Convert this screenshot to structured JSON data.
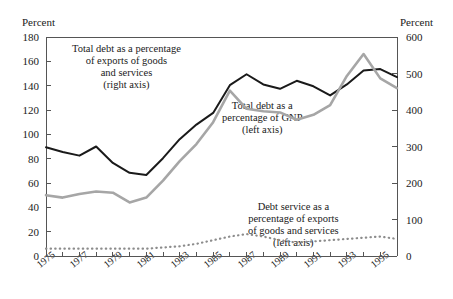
{
  "axes": {
    "left_unit": "Percent",
    "right_unit": "Percent",
    "left_ticks": [
      "180",
      "160",
      "140",
      "120",
      "100",
      "80",
      "60",
      "40",
      "20",
      "0"
    ],
    "right_ticks": [
      "600",
      "500",
      "400",
      "300",
      "200",
      "100",
      "0"
    ],
    "x_ticks": [
      "1975",
      "1977",
      "1979",
      "1981",
      "1983",
      "1985",
      "1987",
      "1989",
      "1991",
      "1993",
      "1995"
    ]
  },
  "annotations": {
    "exports": {
      "line1": "Total debt as a percentage",
      "line2": "of exports of goods",
      "line3": "and services",
      "line4": "(right axis)"
    },
    "gnp": {
      "line1": "Total debt as a",
      "line2": "percentage of GNP",
      "line3": "(left axis)"
    },
    "service": {
      "line1": "Debt service as a",
      "line2": "percentage of exports",
      "line3": "of goods and services",
      "line4": "(left axis)"
    }
  },
  "colors": {
    "exports_line": "#1a1a1a",
    "gnp_line": "#a6a6a6",
    "service_line": "#8c8c8c",
    "frame": "#555555",
    "background": "#ffffff"
  },
  "chart_data": {
    "type": "line",
    "title": "",
    "xlabel": "",
    "ylabel": "Percent",
    "y2label": "Percent",
    "x": [
      1975,
      1976,
      1977,
      1978,
      1979,
      1980,
      1981,
      1982,
      1983,
      1984,
      1985,
      1986,
      1987,
      1988,
      1989,
      1990,
      1991,
      1992,
      1993,
      1994,
      1995,
      1996
    ],
    "xlim": [
      1975,
      1996
    ],
    "ylim": [
      0,
      180
    ],
    "y2lim": [
      0,
      600
    ],
    "grid": false,
    "legend": "inline-annotations",
    "series": [
      {
        "name": "Total debt as a percentage of exports of goods and services",
        "axis": "right",
        "unit": "percent",
        "style": "solid-dark",
        "color": "#1a1a1a",
        "values": [
          298,
          285,
          275,
          300,
          255,
          228,
          222,
          268,
          320,
          360,
          392,
          468,
          498,
          470,
          458,
          480,
          465,
          440,
          470,
          508,
          512,
          490
        ]
      },
      {
        "name": "Total debt as a percentage of GNP",
        "axis": "left",
        "unit": "percent",
        "style": "solid-grey",
        "color": "#a6a6a6",
        "values": [
          50,
          48,
          51,
          53,
          52,
          44,
          48,
          62,
          78,
          92,
          110,
          136,
          121,
          119,
          118,
          112,
          116,
          124,
          148,
          166,
          146,
          138
        ]
      },
      {
        "name": "Debt service as a percentage of exports of goods and services",
        "axis": "left",
        "unit": "percent",
        "style": "dotted",
        "color": "#8c8c8c",
        "values": [
          6,
          6,
          6,
          6,
          6,
          6,
          6,
          7,
          8,
          10,
          13,
          16,
          18,
          16,
          13,
          11,
          12,
          13,
          14,
          15,
          16,
          14
        ]
      }
    ],
    "series_right_scaled_note": "right-axis series plotted against 0-600 range; left-axis series against 0-180 range"
  }
}
